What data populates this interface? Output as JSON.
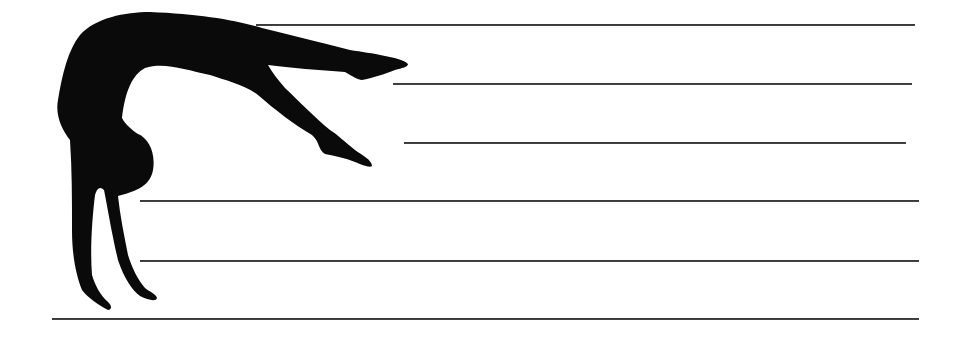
{
  "worksheet": {
    "title": "",
    "illustration": {
      "subject": "gymnast-backbend-silhouette",
      "color": "#0a0a0a"
    },
    "line_color": "#3a3a3a",
    "lines": [
      {
        "x1": 256,
        "x2": 915,
        "y": 24
      },
      {
        "x1": 393,
        "x2": 912,
        "y": 83
      },
      {
        "x1": 404,
        "x2": 906,
        "y": 142
      },
      {
        "x1": 140,
        "x2": 919,
        "y": 200
      },
      {
        "x1": 140,
        "x2": 919,
        "y": 260
      },
      {
        "x1": 52,
        "x2": 919,
        "y": 318
      }
    ]
  }
}
